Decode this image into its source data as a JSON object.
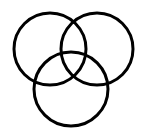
{
  "diagram": {
    "type": "three-circle-venn",
    "background": "#ffffff",
    "stroke_color": "#000000",
    "stroke_width": 3,
    "circles": [
      {
        "name": "left",
        "cx": 50,
        "cy": 49,
        "r": 36
      },
      {
        "name": "right",
        "cx": 97,
        "cy": 49,
        "r": 36
      },
      {
        "name": "bottom",
        "cx": 71,
        "cy": 89,
        "r": 37
      }
    ]
  }
}
